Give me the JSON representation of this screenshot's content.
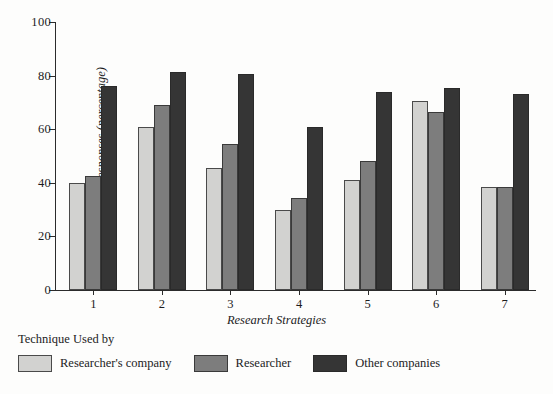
{
  "chart_data": {
    "type": "bar",
    "title": "",
    "xlabel": "Research Strategies",
    "ylabel": "Affirmative Responses (percentage)",
    "categories": [
      "1",
      "2",
      "3",
      "4",
      "5",
      "6",
      "7"
    ],
    "ylim": [
      0,
      100
    ],
    "yticks": [
      0,
      20,
      40,
      60,
      80,
      100
    ],
    "ytick_labels": [
      "0",
      "20",
      "40",
      "60",
      "80",
      "100"
    ],
    "grid": false,
    "legend_position": "below",
    "legend_title": "Technique Used by",
    "series": [
      {
        "name": "Researcher's company",
        "color": "#d2d2d0",
        "values": [
          40,
          61,
          45.5,
          30,
          41,
          70.5,
          38.5
        ]
      },
      {
        "name": "Researcher",
        "color": "#7d7d7d",
        "values": [
          42.5,
          69,
          54.5,
          34.5,
          48,
          66.5,
          38.5
        ]
      },
      {
        "name": "Other companies",
        "color": "#353535",
        "values": [
          76,
          81.5,
          80.5,
          61,
          74,
          75.5,
          73
        ]
      }
    ]
  }
}
